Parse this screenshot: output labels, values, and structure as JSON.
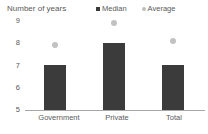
{
  "chart_data": {
    "type": "bar",
    "title": "Number of years",
    "xlabel": "",
    "ylabel": "Number of years",
    "ylim": [
      5,
      9
    ],
    "yticks": [
      9,
      8,
      7,
      6,
      5
    ],
    "grid": false,
    "legend_position": "top-right",
    "categories": [
      "Government",
      "Private",
      "Total"
    ],
    "series": [
      {
        "name": "Median",
        "type": "bar",
        "color": "#3b3b3b",
        "marker": "square",
        "values": [
          7,
          8,
          7
        ]
      },
      {
        "name": "Average",
        "type": "scatter",
        "color": "#c2c2c2",
        "marker": "circle",
        "values": [
          7.9,
          8.85,
          8.05
        ]
      }
    ]
  },
  "legend": {
    "items": [
      {
        "label": "Median",
        "marker": "square",
        "color": "#3b3b3b"
      },
      {
        "label": "Average",
        "marker": "circle",
        "color": "#c2c2c2"
      }
    ]
  },
  "axis": {
    "y_tick_labels": [
      "9",
      "8",
      "7",
      "6",
      "5"
    ],
    "x_tick_labels": [
      "Government",
      "Private",
      "Total"
    ]
  }
}
